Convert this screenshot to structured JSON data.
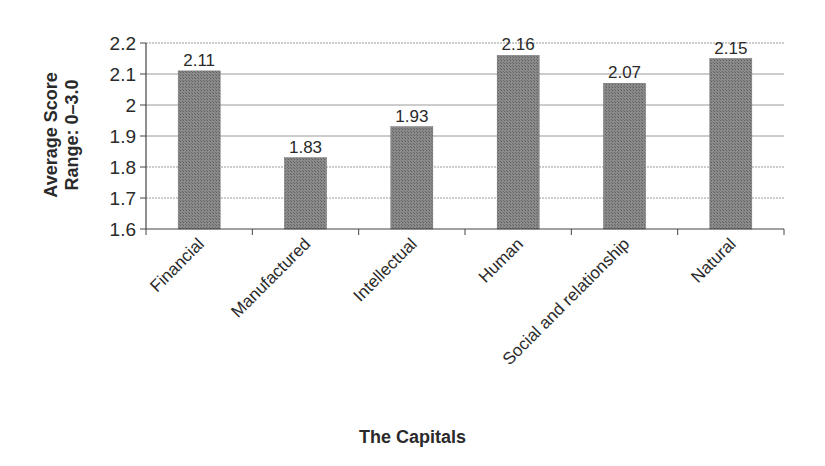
{
  "chart_data": {
    "type": "bar",
    "title": "",
    "xlabel": "The Capitals",
    "ylabel_lines": [
      "Average Score",
      "Range: 0–3.0"
    ],
    "ylabel": "Average Score Range: 0–3.0",
    "categories": [
      "Financial",
      "Manufactured",
      "Intellectual",
      "Human",
      "Social and relationship",
      "Natural"
    ],
    "values": [
      2.11,
      1.83,
      1.93,
      2.16,
      2.07,
      2.15
    ],
    "data_labels": [
      "2.11",
      "1.83",
      "1.93",
      "2.16",
      "2.07",
      "2.15"
    ],
    "ylim": [
      1.6,
      2.2
    ],
    "yticks": [
      1.6,
      1.7,
      1.8,
      1.9,
      2.0,
      2.1,
      2.2
    ],
    "ytick_labels": [
      "1.6",
      "1.7",
      "1.8",
      "1.9",
      "2",
      "2.1",
      "2.2"
    ],
    "grid": true,
    "legend": null,
    "bar_color": "#7a7a7a"
  }
}
